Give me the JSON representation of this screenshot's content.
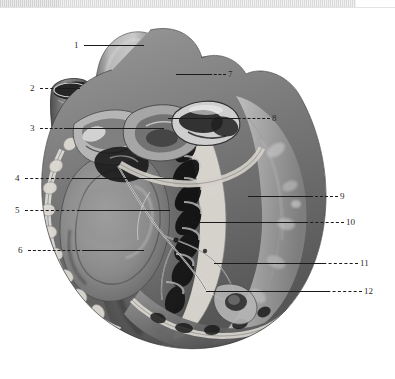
{
  "figure": {
    "title_visible": false,
    "background_color": "#ffffff",
    "ink_color": "#1b1b1b",
    "top_strip_color": "#d4d4d4"
  },
  "labels": {
    "left": [
      {
        "id": "1",
        "text": "1",
        "x": 74,
        "y": 41,
        "line_x": 84,
        "line_w": 48,
        "line_y": 45
      },
      {
        "id": "2",
        "text": "2",
        "x": 30,
        "y": 84,
        "line_x": 40,
        "line_w": 34,
        "line_y": 88
      },
      {
        "id": "3",
        "text": "3",
        "x": 30,
        "y": 124,
        "line_x": 40,
        "line_w": 37,
        "line_y": 128
      },
      {
        "id": "4",
        "text": "4",
        "x": 15,
        "y": 174,
        "line_x": 25,
        "line_w": 55,
        "line_y": 178
      },
      {
        "id": "5",
        "text": "5",
        "x": 15,
        "y": 206,
        "line_x": 25,
        "line_w": 60,
        "line_y": 210
      },
      {
        "id": "6",
        "text": "6",
        "x": 18,
        "y": 246,
        "line_x": 28,
        "line_w": 62,
        "line_y": 250
      }
    ],
    "right": [
      {
        "id": "7",
        "text": "7",
        "x": 228,
        "y": 70,
        "line_x": 200,
        "line_w": 26,
        "line_y": 74
      },
      {
        "id": "8",
        "text": "8",
        "x": 272,
        "y": 114,
        "line_x": 228,
        "line_w": 42,
        "line_y": 118
      },
      {
        "id": "9",
        "text": "9",
        "x": 340,
        "y": 192,
        "line_x": 300,
        "line_w": 38,
        "line_y": 196
      },
      {
        "id": "10",
        "text": "10",
        "x": 346,
        "y": 218,
        "line_x": 300,
        "line_w": 44,
        "line_y": 222
      },
      {
        "id": "11",
        "text": "11",
        "x": 360,
        "y": 259,
        "line_x": 318,
        "line_w": 40,
        "line_y": 263
      },
      {
        "id": "12",
        "text": "12",
        "x": 364,
        "y": 287,
        "line_x": 322,
        "line_w": 40,
        "line_y": 291
      }
    ]
  },
  "leaders_inner": [
    {
      "name": "leader-1-inner",
      "x": 84,
      "y": 45,
      "w": 60
    },
    {
      "name": "leader-2-inner",
      "x": 58,
      "y": 88,
      "w": 22
    },
    {
      "name": "leader-3-inner",
      "x": 64,
      "y": 128,
      "w": 100
    },
    {
      "name": "leader-4-inner",
      "x": 72,
      "y": 178,
      "w": 110
    },
    {
      "name": "leader-5-inner",
      "x": 78,
      "y": 210,
      "w": 92
    },
    {
      "name": "leader-6-inner",
      "x": 84,
      "y": 250,
      "w": 60
    },
    {
      "name": "leader-7-inner",
      "x": 176,
      "y": 74,
      "w": 34
    },
    {
      "name": "leader-8-inner",
      "x": 168,
      "y": 118,
      "w": 72
    },
    {
      "name": "leader-9-inner",
      "x": 248,
      "y": 196,
      "w": 62
    },
    {
      "name": "leader-10-inner",
      "x": 190,
      "y": 222,
      "w": 118
    },
    {
      "name": "leader-11-inner",
      "x": 214,
      "y": 263,
      "w": 110
    },
    {
      "name": "leader-12-inner",
      "x": 206,
      "y": 291,
      "w": 122
    }
  ]
}
